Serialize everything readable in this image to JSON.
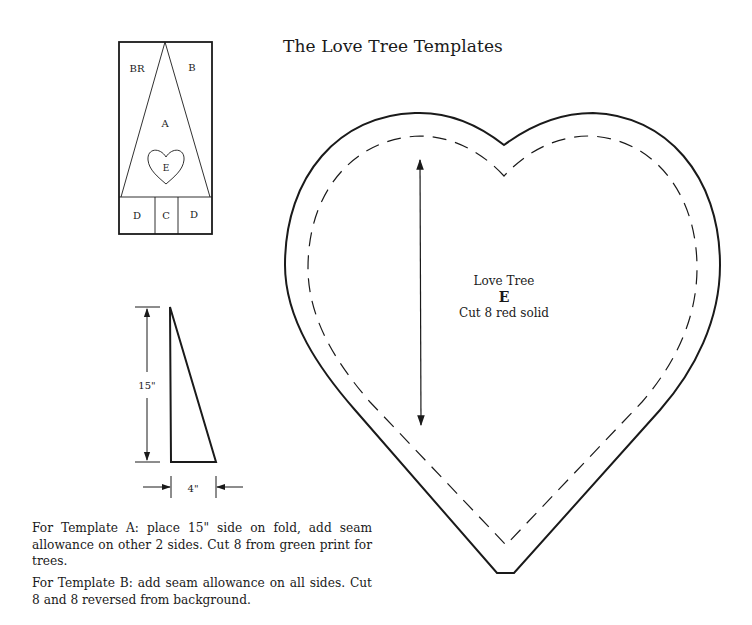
{
  "page": {
    "title": "The Love Tree Templates"
  },
  "block_diagram": {
    "labels": {
      "br": "BR",
      "b": "B",
      "a": "A",
      "e": "E",
      "d_left": "D",
      "c": "C",
      "d_right": "D"
    }
  },
  "template_a": {
    "height_label": "15\"",
    "width_label": "4\""
  },
  "heart_template": {
    "name": "Love Tree",
    "letter": "E",
    "instructions": "Cut 8 red solid"
  },
  "notes": {
    "template_a": "For Template A: place 15\" side on fold, add seam allowance on other 2 sides. Cut 8 from green print for trees.",
    "template_b": "For Template B: add seam allowance on all sides. Cut 8 and 8 reversed from background."
  },
  "colors": {
    "ink": "#1a1a1a",
    "paper": "#ffffff"
  }
}
